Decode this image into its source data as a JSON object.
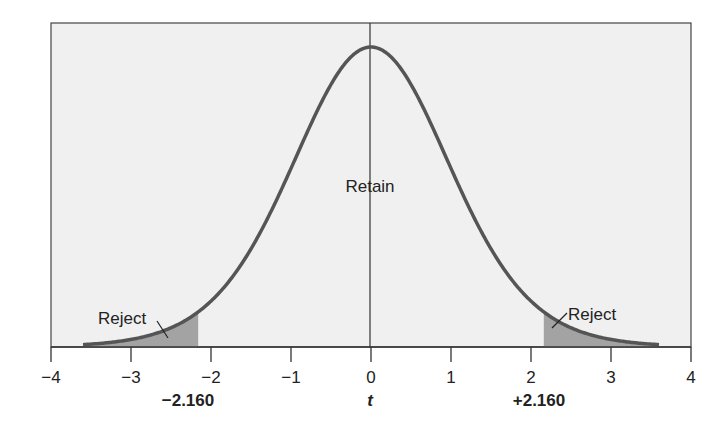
{
  "chart_data": {
    "type": "area",
    "title": "",
    "xlabel": "t",
    "ylabel": "",
    "xlim": [
      -4,
      4
    ],
    "x_ticks": [
      -4,
      -3,
      -2,
      -1,
      0,
      1,
      2,
      3,
      4
    ],
    "x_tick_labels": [
      "−4",
      "−3",
      "−2",
      "−1",
      "0",
      "1",
      "2",
      "3",
      "4"
    ],
    "grid": false,
    "legend": null,
    "critical_values": [
      -2.16,
      2.16
    ],
    "critical_labels": [
      "−2.160",
      "+2.160"
    ],
    "degrees_of_freedom_estimate": 13,
    "regions": [
      {
        "name": "Reject",
        "from": -4,
        "to": -2.16,
        "shaded": true
      },
      {
        "name": "Retain",
        "from": -2.16,
        "to": 2.16,
        "shaded": false
      },
      {
        "name": "Reject",
        "from": 2.16,
        "to": 4,
        "shaded": true
      }
    ],
    "curve_range": [
      -3.6,
      3.6
    ],
    "annotations": [
      "Reject",
      "Retain",
      "Reject"
    ]
  },
  "labels": {
    "retain": "Retain",
    "reject_left": "Reject",
    "reject_right": "Reject",
    "axis_title": "t",
    "crit_left": "−2.160",
    "crit_right": "+2.160"
  },
  "colors": {
    "background": "#f0f0f0",
    "curve": "#555555",
    "shade": "#a3a3a3",
    "axis": "#333333"
  }
}
